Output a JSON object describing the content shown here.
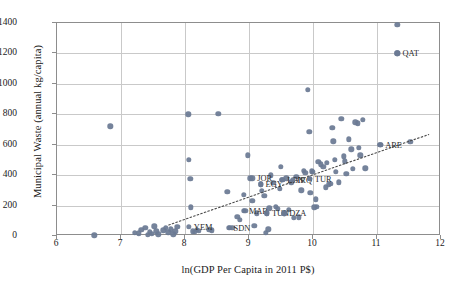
{
  "chart_data": {
    "type": "scatter",
    "title": "",
    "xlabel": "ln(GDP Per Capita in 2011 P$)",
    "ylabel": "Municipal Waste (annual kg/capita)",
    "xlim": [
      6,
      12
    ],
    "ylim": [
      0,
      1400
    ],
    "xticks": [
      "6",
      "7",
      "8",
      "9",
      "10",
      "11",
      "12"
    ],
    "yticks": [
      "0",
      "200",
      "400",
      "600",
      "800",
      "1000",
      "1200",
      "1400"
    ],
    "grid": true,
    "legend": "none",
    "marker_color": "#6b7a93",
    "trendline": {
      "style": "dotted",
      "color": "#4a4a4a",
      "x_start": 7.75,
      "y_start": 60,
      "x_end": 11.85,
      "y_end": 660
    },
    "annotations": [
      {
        "label": "QAT",
        "x": 11.32,
        "y": 1200
      },
      {
        "label": "ARE",
        "x": 11.05,
        "y": 600
      },
      {
        "label": "JOR",
        "x": 9.05,
        "y": 380
      },
      {
        "label": "EGY",
        "x": 9.18,
        "y": 340
      },
      {
        "label": "LBN",
        "x": 9.52,
        "y": 370
      },
      {
        "label": "IRQ",
        "x": 9.68,
        "y": 370
      },
      {
        "label": "TUR",
        "x": 9.95,
        "y": 375
      },
      {
        "label": "MAR",
        "x": 8.92,
        "y": 165
      },
      {
        "label": "TUN",
        "x": 9.28,
        "y": 150
      },
      {
        "label": "DZA",
        "x": 9.55,
        "y": 150
      },
      {
        "label": "YEM",
        "x": 8.06,
        "y": 60
      },
      {
        "label": "SDN",
        "x": 8.68,
        "y": 55
      }
    ],
    "points": [
      [
        6.58,
        5
      ],
      [
        6.83,
        722
      ],
      [
        7.22,
        22
      ],
      [
        7.28,
        18
      ],
      [
        7.32,
        40
      ],
      [
        7.38,
        55
      ],
      [
        7.42,
        8
      ],
      [
        7.45,
        28
      ],
      [
        7.48,
        14
      ],
      [
        7.52,
        65
      ],
      [
        7.55,
        30
      ],
      [
        7.58,
        12
      ],
      [
        7.66,
        38
      ],
      [
        7.7,
        52
      ],
      [
        7.74,
        25
      ],
      [
        7.78,
        45
      ],
      [
        7.82,
        10
      ],
      [
        7.85,
        30
      ],
      [
        7.88,
        62
      ],
      [
        8.05,
        800
      ],
      [
        8.06,
        500
      ],
      [
        8.08,
        375
      ],
      [
        8.09,
        188
      ],
      [
        8.12,
        30
      ],
      [
        8.15,
        28
      ],
      [
        8.18,
        42
      ],
      [
        8.22,
        35
      ],
      [
        8.38,
        40
      ],
      [
        8.42,
        38
      ],
      [
        8.52,
        803
      ],
      [
        8.66,
        292
      ],
      [
        8.7,
        55
      ],
      [
        8.74,
        52
      ],
      [
        8.82,
        128
      ],
      [
        8.86,
        108
      ],
      [
        8.92,
        270
      ],
      [
        8.94,
        165
      ],
      [
        8.98,
        530
      ],
      [
        9.02,
        380
      ],
      [
        9.05,
        232
      ],
      [
        9.08,
        68
      ],
      [
        9.12,
        148
      ],
      [
        9.18,
        340
      ],
      [
        9.2,
        298
      ],
      [
        9.24,
        265
      ],
      [
        9.26,
        20
      ],
      [
        9.28,
        150
      ],
      [
        9.3,
        45
      ],
      [
        9.32,
        182
      ],
      [
        9.34,
        400
      ],
      [
        9.38,
        350
      ],
      [
        9.42,
        192
      ],
      [
        9.45,
        180
      ],
      [
        9.48,
        310
      ],
      [
        9.5,
        455
      ],
      [
        9.52,
        370
      ],
      [
        9.55,
        150
      ],
      [
        9.58,
        380
      ],
      [
        9.62,
        172
      ],
      [
        9.66,
        352
      ],
      [
        9.7,
        118
      ],
      [
        9.74,
        390
      ],
      [
        9.78,
        122
      ],
      [
        9.82,
        300
      ],
      [
        9.86,
        430
      ],
      [
        9.88,
        415
      ],
      [
        9.92,
        960
      ],
      [
        9.94,
        683
      ],
      [
        9.95,
        375
      ],
      [
        9.96,
        282
      ],
      [
        9.98,
        425
      ],
      [
        10.0,
        420
      ],
      [
        10.02,
        188
      ],
      [
        10.04,
        240
      ],
      [
        10.06,
        190
      ],
      [
        10.08,
        488
      ],
      [
        10.12,
        470
      ],
      [
        10.16,
        455
      ],
      [
        10.2,
        320
      ],
      [
        10.22,
        480
      ],
      [
        10.25,
        340
      ],
      [
        10.28,
        345
      ],
      [
        10.3,
        712
      ],
      [
        10.32,
        622
      ],
      [
        10.34,
        500
      ],
      [
        10.36,
        420
      ],
      [
        10.4,
        352
      ],
      [
        10.44,
        770
      ],
      [
        10.48,
        525
      ],
      [
        10.5,
        490
      ],
      [
        10.52,
        408
      ],
      [
        10.56,
        635
      ],
      [
        10.6,
        570
      ],
      [
        10.62,
        440
      ],
      [
        10.66,
        748
      ],
      [
        10.7,
        742
      ],
      [
        10.72,
        580
      ],
      [
        10.74,
        530
      ],
      [
        10.78,
        765
      ],
      [
        10.82,
        445
      ],
      [
        11.05,
        600
      ],
      [
        11.32,
        1387
      ],
      [
        11.32,
        1200
      ],
      [
        11.52,
        620
      ]
    ]
  }
}
